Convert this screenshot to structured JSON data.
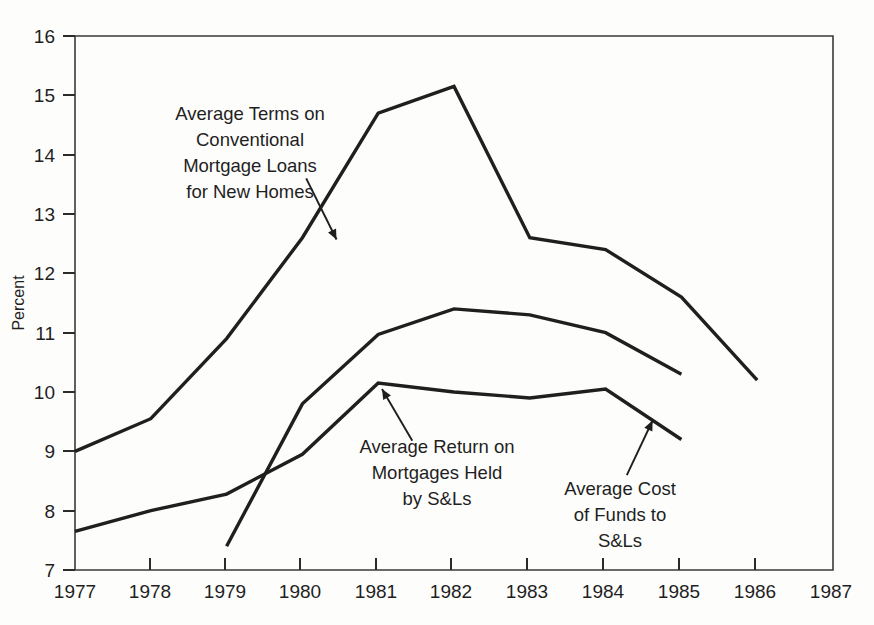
{
  "chart_data": {
    "type": "line",
    "title": "",
    "xlabel": "",
    "ylabel": "Percent",
    "xlim": [
      1977,
      1987
    ],
    "ylim": [
      7,
      16
    ],
    "grid": false,
    "legend_position": "inline-annotations",
    "x_ticks": [
      "1977",
      "1978",
      "1979",
      "1980",
      "1981",
      "1982",
      "1983",
      "1984",
      "1985",
      "1986",
      "1987"
    ],
    "y_ticks": [
      "7",
      "8",
      "9",
      "10",
      "11",
      "12",
      "13",
      "14",
      "15",
      "16"
    ],
    "series": [
      {
        "name": "Average Terms on Conventional Mortgage Loans for New Homes",
        "x": [
          1977,
          1978,
          1979,
          1980,
          1981,
          1982,
          1983,
          1984,
          1985,
          1986
        ],
        "values": [
          9.0,
          9.55,
          10.9,
          12.6,
          14.7,
          15.15,
          12.6,
          12.4,
          11.6,
          10.2
        ]
      },
      {
        "name": "Average Return on Mortgages Held by S&Ls",
        "x": [
          1977,
          1978,
          1979,
          1980,
          1981,
          1982,
          1983,
          1984,
          1985
        ],
        "values": [
          7.65,
          8.0,
          8.28,
          8.95,
          10.15,
          10.0,
          9.9,
          10.05,
          9.2
        ]
      },
      {
        "name": "Average Cost of Funds to S&Ls",
        "x": [
          1979,
          1980,
          1981,
          1982,
          1983,
          1984,
          1985
        ],
        "values": [
          7.4,
          9.8,
          10.97,
          11.4,
          11.3,
          11.0,
          10.3
        ]
      }
    ],
    "annotations": [
      {
        "id": "annotation-terms",
        "lines": [
          "Average Terms on",
          "Conventional",
          "Mortgage Loans",
          "for New Homes"
        ],
        "arrow_from": [
          1980.05,
          13.6
        ],
        "arrow_to": [
          1980.45,
          12.57
        ]
      },
      {
        "id": "annotation-return",
        "lines": [
          "Average Return on",
          "Mortgages Held",
          "by S&Ls"
        ],
        "arrow_from": [
          1981.45,
          9.18
        ],
        "arrow_to": [
          1981.05,
          10.05
        ]
      },
      {
        "id": "annotation-cost",
        "lines": [
          "Average Cost",
          "of Funds to",
          "S&Ls"
        ],
        "arrow_from": [
          1984.28,
          8.6
        ],
        "arrow_to": [
          1984.62,
          9.52
        ]
      }
    ]
  },
  "axis": {
    "y_title": "Percent"
  },
  "ticks": {
    "y": [
      "16",
      "15",
      "14",
      "13",
      "12",
      "11",
      "10",
      "9",
      "8",
      "7"
    ],
    "x": [
      "1977",
      "1978",
      "1979",
      "1980",
      "1981",
      "1982",
      "1983",
      "1984",
      "1985",
      "1986",
      "1987"
    ]
  },
  "annotations": {
    "terms": {
      "l0": "Average Terms on",
      "l1": "Conventional",
      "l2": "Mortgage Loans",
      "l3": "for New Homes"
    },
    "ret": {
      "l0": "Average Return on",
      "l1": "Mortgages Held",
      "l2": "by S&Ls"
    },
    "cost": {
      "l0": "Average Cost",
      "l1": "of Funds to",
      "l2": "S&Ls"
    }
  },
  "colors": {
    "line": "#1f1f1f",
    "axis": "#3a3a3a",
    "background": "#fdfdfc"
  }
}
